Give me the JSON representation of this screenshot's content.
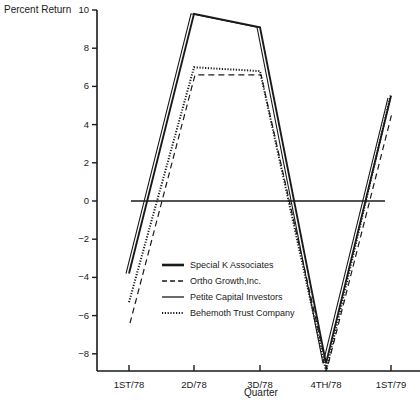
{
  "chart_data": {
    "type": "line",
    "title": "",
    "xlabel": "Quarter",
    "ylabel": "Percent Return",
    "categories": [
      "1ST/78",
      "2D/78",
      "3D/78",
      "4TH/78",
      "1ST/79"
    ],
    "yticks": [
      10,
      8,
      6,
      4,
      2,
      0,
      -2,
      -4,
      -6,
      -8
    ],
    "ylim": [
      -9,
      10
    ],
    "grid": false,
    "legend_position": "inside-lower-center",
    "series": [
      {
        "name": "Special K Associates",
        "style": "thick-solid",
        "values": [
          -3.8,
          9.8,
          9.1,
          -8.5,
          5.5
        ]
      },
      {
        "name": "Ortho Growth,Inc.",
        "style": "dashed",
        "values": [
          -6.4,
          6.6,
          6.6,
          -8.8,
          4.6
        ]
      },
      {
        "name": "Petite Capital Investors",
        "style": "thin-solid",
        "values": [
          -3.8,
          9.8,
          9.1,
          -8.5,
          5.4
        ]
      },
      {
        "name": "Behemoth Trust Company",
        "style": "dotted",
        "values": [
          -5.3,
          7.0,
          6.8,
          -8.9,
          5.6
        ]
      }
    ],
    "reference_line": {
      "y": 0,
      "x_start": "between 1ST/78 and 2D/78",
      "x_end": "right edge"
    }
  },
  "labels": {
    "ylabel": "Percent Return",
    "xlabel": "Quarter",
    "legend": [
      "Special K Associates",
      "Ortho Growth,Inc.",
      "Petite Capital Investors",
      "Behemoth Trust Company"
    ]
  }
}
